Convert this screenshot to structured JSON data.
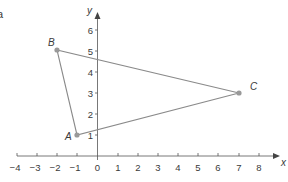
{
  "part_label": "a",
  "axes": {
    "x_label": "x",
    "y_label": "y",
    "x_ticks": [
      "−4",
      "−3",
      "−2",
      "−1",
      "0",
      "1",
      "2",
      "3",
      "4",
      "5",
      "6",
      "7",
      "8"
    ],
    "y_ticks": [
      "1",
      "2",
      "3",
      "4",
      "5",
      "6"
    ]
  },
  "points": [
    {
      "name": "A",
      "x": -1,
      "y": 1
    },
    {
      "name": "B",
      "x": -2,
      "y": 5
    },
    {
      "name": "C",
      "x": 7,
      "y": 3
    }
  ],
  "colors": {
    "axis": "#555555",
    "triangle": "#8a8a8a",
    "point": "#999999",
    "text": "#3a3a3a"
  }
}
